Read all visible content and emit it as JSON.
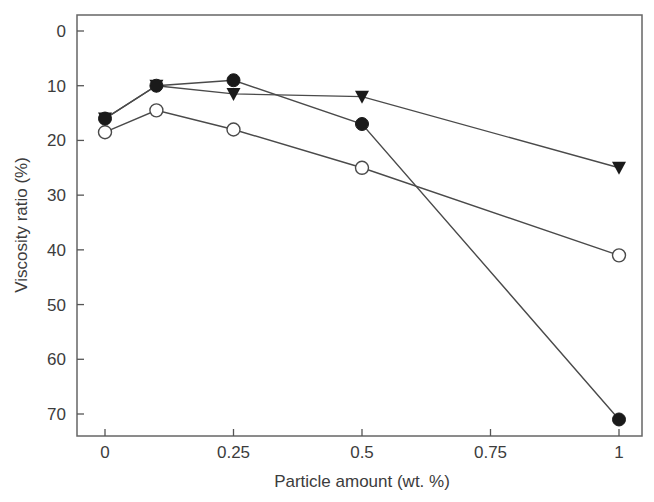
{
  "chart_data": {
    "type": "line",
    "title": "",
    "xlabel": "Particle amount (wt. %)",
    "ylabel": "Viscosity ratio (%)",
    "xlim": [
      -0.05,
      1.045
    ],
    "ylim": [
      75,
      -3
    ],
    "y_inverted": true,
    "grid": false,
    "legend": "none",
    "x_ticks": [
      0,
      0.25,
      0.5,
      0.75,
      1
    ],
    "x_tick_labels": [
      "0",
      "0.25",
      "0.5",
      "0.75",
      "1"
    ],
    "y_ticks": [
      0,
      10,
      20,
      30,
      40,
      50,
      60,
      70
    ],
    "y_tick_labels": [
      "0",
      "10",
      "20",
      "30",
      "40",
      "50",
      "60",
      "70"
    ],
    "x": [
      0,
      0.1,
      0.25,
      0.5,
      1
    ],
    "series": [
      {
        "name": "filled-circle",
        "marker": "circle-filled",
        "values": [
          16,
          10,
          9,
          17,
          71
        ]
      },
      {
        "name": "filled-triangle",
        "marker": "triangle-down-filled",
        "values": [
          16,
          10,
          11.5,
          12,
          25
        ]
      },
      {
        "name": "open-circle",
        "marker": "circle-open",
        "values": [
          18.5,
          14.5,
          18,
          25,
          41
        ]
      }
    ]
  },
  "colors": {
    "line": "#4a4a4a",
    "marker_fill": "#1a1a1a",
    "axis": "#555555",
    "text": "#3c3c3c"
  }
}
